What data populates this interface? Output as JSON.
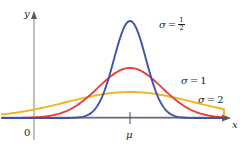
{
  "figure": {
    "name": "normal-distribution-density-curves",
    "background_color": "#ffffff"
  },
  "axes": {
    "y_label": "y",
    "x_label": "x",
    "origin_label": "0",
    "mean_tick_label": "μ",
    "axis_color": "#808285",
    "baseline_color": "#6d4f8c"
  },
  "labels": {
    "sigma_half": {
      "symbol": "σ",
      "equals": "=",
      "numerator": "1",
      "denominator": "2",
      "text": "σ = 1/2"
    },
    "sigma_one": {
      "symbol": "σ",
      "equals": "=",
      "value": "1",
      "text": "σ = 1"
    },
    "sigma_two": {
      "symbol": "σ",
      "equals": "=",
      "value": "2",
      "text": "σ = 2"
    }
  },
  "colors": {
    "sigma_half": "#3b55a4",
    "sigma_one": "#e8403a",
    "sigma_two": "#f0b323",
    "axis": "#808285",
    "baseline": "#6d4f8c",
    "text": "#231f20"
  },
  "chart_data": {
    "type": "line",
    "title": "",
    "xlabel": "x",
    "ylabel": "y",
    "grid": false,
    "legend": "inline-annotations",
    "x_axis": {
      "ticks": [
        {
          "label": "0",
          "pixel_x": 34
        },
        {
          "label": "μ",
          "pixel_x": 130
        }
      ],
      "arrow": true,
      "baseline_pixel_y": 118
    },
    "y_axis": {
      "arrow": true,
      "pixel_x": 34,
      "top_pixel_y": 14,
      "ticks": []
    },
    "function": "normal probability density f(x) = 1/(sigma*sqrt(2*pi)) * exp(-(x-mu)^2/(2*sigma^2))",
    "mu": 0,
    "series": [
      {
        "name": "σ = 1/2",
        "sigma": 0.5,
        "color": "#3b55a4",
        "peak_value": 0.7979,
        "peak_pixel": {
          "x": 130,
          "y": 21
        },
        "x": [
          -4,
          -3.5,
          -3,
          -2.5,
          -2,
          -1.75,
          -1.5,
          -1.25,
          -1,
          -0.75,
          -0.5,
          -0.25,
          0,
          0.25,
          0.5,
          0.75,
          1,
          1.25,
          1.5,
          1.75,
          2,
          2.5,
          3,
          3.5,
          4
        ],
        "y": [
          0.0,
          0.0,
          0.0,
          0.0,
          0.0003,
          0.0022,
          0.0089,
          0.0292,
          0.108,
          0.2636,
          0.4839,
          0.7041,
          0.7979,
          0.7041,
          0.4839,
          0.2636,
          0.108,
          0.0292,
          0.0089,
          0.0022,
          0.0003,
          0.0,
          0.0,
          0.0,
          0.0
        ]
      },
      {
        "name": "σ = 1",
        "sigma": 1,
        "color": "#e8403a",
        "peak_value": 0.3989,
        "peak_pixel": {
          "x": 130,
          "y": 68
        },
        "x": [
          -4,
          -3.5,
          -3,
          -2.5,
          -2,
          -1.75,
          -1.5,
          -1.25,
          -1,
          -0.75,
          -0.5,
          -0.25,
          0,
          0.25,
          0.5,
          0.75,
          1,
          1.25,
          1.5,
          1.75,
          2,
          2.5,
          3,
          3.5,
          4
        ],
        "y": [
          0.0001,
          0.0009,
          0.0044,
          0.0175,
          0.054,
          0.0863,
          0.1295,
          0.1826,
          0.242,
          0.3011,
          0.3521,
          0.3867,
          0.3989,
          0.3867,
          0.3521,
          0.3011,
          0.242,
          0.1826,
          0.1295,
          0.0863,
          0.054,
          0.0175,
          0.0044,
          0.0009,
          0.0001
        ]
      },
      {
        "name": "σ = 2",
        "sigma": 2,
        "color": "#f0b323",
        "peak_value": 0.1995,
        "peak_pixel": {
          "x": 130,
          "y": 92
        },
        "x": [
          -4,
          -3.5,
          -3,
          -2.5,
          -2,
          -1.75,
          -1.5,
          -1.25,
          -1,
          -0.75,
          -0.5,
          -0.25,
          0,
          0.25,
          0.5,
          0.75,
          1,
          1.25,
          1.5,
          1.75,
          2,
          2.5,
          3,
          3.5,
          4
        ],
        "y": [
          0.027,
          0.0417,
          0.0605,
          0.0821,
          0.121,
          0.1379,
          0.1518,
          0.1669,
          0.176,
          0.1862,
          0.1933,
          0.1979,
          0.1995,
          0.1979,
          0.1933,
          0.1862,
          0.176,
          0.1669,
          0.1518,
          0.1379,
          0.121,
          0.0821,
          0.0605,
          0.0417,
          0.027
        ]
      }
    ]
  }
}
